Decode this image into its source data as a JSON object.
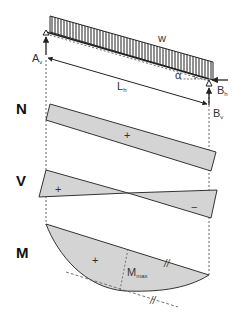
{
  "diagram": {
    "type": "inclined beam internal force diagrams",
    "beam": {
      "load_label": "w",
      "angle_label": "α",
      "span_label": "L",
      "span_subscript": "h"
    },
    "supports": {
      "A_label": "A",
      "A_subscript": "v",
      "B_h_label": "B",
      "B_h_subscript": "h",
      "B_v_label": "B",
      "B_v_subscript": "v"
    },
    "diagrams": {
      "N": {
        "label": "N",
        "sign": "+"
      },
      "V": {
        "label": "V",
        "sign_left": "+",
        "sign_right": "−"
      },
      "M": {
        "label": "M",
        "sign": "+",
        "max_label": "M",
        "max_subscript": "max",
        "parallel_mark": "//"
      }
    },
    "colors": {
      "fill": "#d4d4d4",
      "line": "#333333",
      "dash": "#555555"
    }
  }
}
